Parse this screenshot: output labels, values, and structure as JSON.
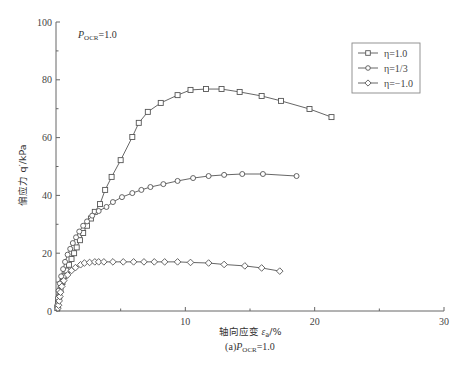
{
  "chart_data": {
    "type": "line",
    "title": "",
    "caption": "(a) P_OCR=1.0",
    "caption_parts": {
      "prefix": "(a)",
      "var": "P",
      "sub": "OCR",
      "suffix": "=1.0"
    },
    "annotation": {
      "var": "P",
      "sub": "OCR",
      "suffix": "=1.0"
    },
    "xlabel": "轴向应变 ε_a/%",
    "xlabel_parts": {
      "text": "轴向应变 ",
      "var": "ε",
      "sub": "a",
      "suffix": "/%"
    },
    "ylabel": "偏应力 q′/kPa",
    "xlim": [
      0,
      30
    ],
    "ylim": [
      0,
      100
    ],
    "xticks": [
      0,
      10,
      20,
      30
    ],
    "xticks_minor": [
      5,
      15,
      25
    ],
    "yticks": [
      0,
      20,
      40,
      60,
      80,
      100
    ],
    "yticks_minor": [
      10,
      30,
      50,
      70,
      90
    ],
    "grid": false,
    "legend_position": "upper right",
    "series": [
      {
        "name": "η=1.0",
        "marker": "square",
        "x": [
          0.1,
          0.15,
          0.25,
          0.35,
          0.5,
          0.65,
          0.8,
          1.0,
          1.2,
          1.4,
          1.6,
          1.85,
          2.1,
          2.4,
          2.7,
          3.0,
          3.4,
          3.8,
          4.3,
          5.0,
          5.9,
          6.4,
          7.1,
          8.1,
          9.4,
          10.4,
          11.6,
          12.8,
          14.2,
          15.9,
          17.4,
          19.6,
          21.3
        ],
        "y": [
          1,
          3,
          5,
          7.5,
          10,
          12,
          14,
          16,
          18,
          20,
          22,
          24.5,
          27,
          29.5,
          32,
          34.3,
          37,
          41.9,
          46.4,
          52.2,
          60.2,
          65.1,
          68.9,
          72.0,
          74.7,
          76.5,
          76.8,
          76.8,
          75.8,
          74.4,
          72.7,
          69.9,
          67.1
        ]
      },
      {
        "name": "η=1/3",
        "marker": "circle",
        "x": [
          0.1,
          0.15,
          0.2,
          0.3,
          0.4,
          0.55,
          0.7,
          0.9,
          1.1,
          1.3,
          1.55,
          1.8,
          2.1,
          2.4,
          2.8,
          3.3,
          3.9,
          4.4,
          5.1,
          5.9,
          6.6,
          7.3,
          8.3,
          9.4,
          10.6,
          11.8,
          13.0,
          14.4,
          16.0,
          18.6
        ],
        "y": [
          2,
          4.5,
          7,
          9.5,
          12,
          14.5,
          17,
          19.5,
          21.5,
          23.5,
          25.5,
          27.5,
          29.5,
          31,
          33,
          34.6,
          36.0,
          37.7,
          39.4,
          40.8,
          41.9,
          42.9,
          43.9,
          45.0,
          46.0,
          46.7,
          47.1,
          47.4,
          47.4,
          46.7
        ]
      },
      {
        "name": "η=−1.0",
        "marker": "diamond",
        "x": [
          0.15,
          0.2,
          0.25,
          0.3,
          0.35,
          0.45,
          0.6,
          0.9,
          1.2,
          1.5,
          1.9,
          2.2,
          2.6,
          3.0,
          3.3,
          3.7,
          4.4,
          5.2,
          6.0,
          6.8,
          7.6,
          8.4,
          9.4,
          10.4,
          11.8,
          13.0,
          14.6,
          15.9,
          17.3
        ],
        "y": [
          1,
          2,
          3.5,
          5,
          6.5,
          8.5,
          10.5,
          12.5,
          14,
          15,
          16,
          16.6,
          16.8,
          17,
          17,
          17,
          17,
          17,
          17,
          17,
          17,
          17,
          17,
          16.8,
          16.6,
          16.1,
          15.6,
          14.9,
          13.8
        ]
      }
    ]
  },
  "legend": {
    "items": [
      {
        "label": "η=1.0",
        "marker": "square"
      },
      {
        "label": "η=1/3",
        "marker": "circle"
      },
      {
        "label": "η=−1.0",
        "marker": "diamond"
      }
    ]
  },
  "colors": {
    "axis": "#666666",
    "line": "#555555",
    "marker_fill": "#ffffff",
    "text": "#333333"
  }
}
